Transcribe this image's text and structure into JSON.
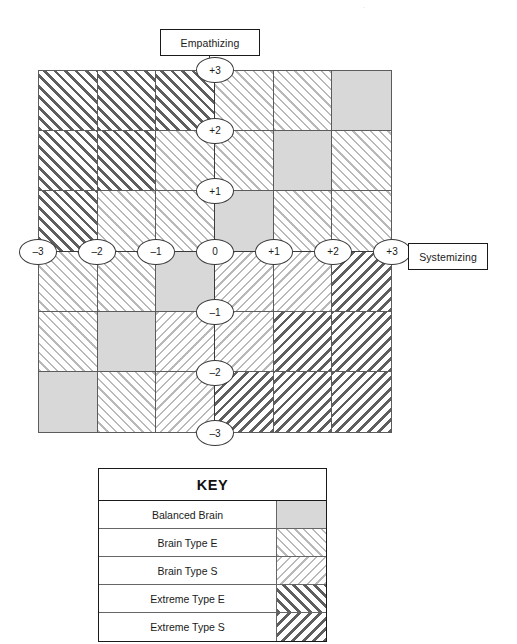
{
  "axes": {
    "vertical_label": "Empathizing",
    "horizontal_label": "Systemizing",
    "vertical_ticks": [
      "+3",
      "+2",
      "+1",
      "0",
      "–1",
      "–2",
      "–3"
    ],
    "horizontal_ticks": [
      "–3",
      "–2",
      "–1",
      "0",
      "+1",
      "+2",
      "+3"
    ]
  },
  "key": {
    "title": "KEY",
    "rows": [
      {
        "label": "Balanced Brain",
        "pattern": "pat-balanced"
      },
      {
        "label": "Brain Type E",
        "pattern": "pat-brain-e"
      },
      {
        "label": "Brain Type S",
        "pattern": "pat-brain-s"
      },
      {
        "label": "Extreme Type E",
        "pattern": "pat-extreme-e"
      },
      {
        "label": "Extreme Type S",
        "pattern": "pat-extreme-s"
      }
    ]
  },
  "colors": {
    "balanced": "#d8d8d8",
    "light_hatch": "#b9b9b9",
    "dark_hatch": "#5e5e5e",
    "grid_line": "#5c5c5c",
    "ink": "#1a1a1a",
    "background": "#ffffff"
  },
  "chart_data": {
    "type": "heatmap",
    "title": "",
    "xlabel": "Systemizing",
    "ylabel": "Empathizing",
    "x": [
      "–3",
      "–2",
      "–1",
      "0",
      "+1",
      "+2",
      "+3"
    ],
    "y": [
      "+3",
      "+2",
      "+1",
      "0",
      "–1",
      "–2",
      "–3"
    ],
    "xlim": [
      -3,
      3
    ],
    "ylim": [
      -3,
      3
    ],
    "grid": true,
    "legend": [
      "Balanced Brain",
      "Brain Type E",
      "Brain Type S",
      "Extreme Type E",
      "Extreme Type S"
    ],
    "categories": [
      "Balanced Brain",
      "Brain Type E",
      "Brain Type S",
      "Extreme Type E",
      "Extreme Type S"
    ],
    "cell_rows": 6,
    "cell_cols": 6,
    "cells": [
      [
        "extreme-e",
        "extreme-e",
        "extreme-e",
        "brain-e",
        "brain-e",
        "balanced"
      ],
      [
        "extreme-e",
        "extreme-e",
        "brain-e",
        "brain-e",
        "balanced",
        "brain-e"
      ],
      [
        "extreme-e",
        "brain-e",
        "brain-e",
        "balanced",
        "brain-e",
        "brain-e"
      ],
      [
        "brain-e",
        "brain-e",
        "balanced",
        "brain-s",
        "brain-s",
        "extreme-s"
      ],
      [
        "brain-e",
        "balanced",
        "brain-s",
        "brain-s",
        "extreme-s",
        "extreme-s"
      ],
      [
        "balanced",
        "brain-e",
        "brain-s",
        "extreme-s",
        "extreme-s",
        "extreme-s"
      ]
    ]
  }
}
